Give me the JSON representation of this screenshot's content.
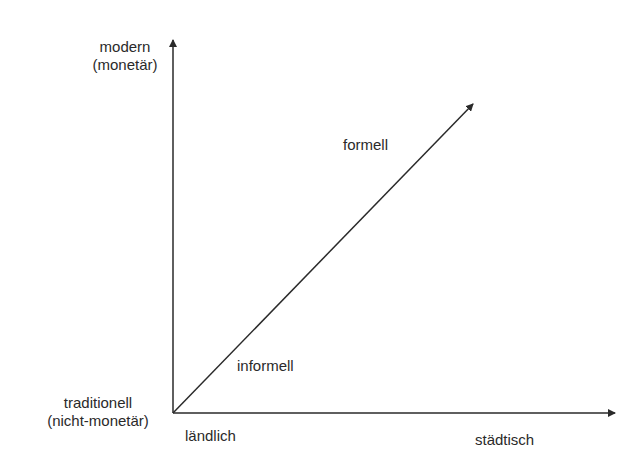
{
  "diagram": {
    "y_axis": {
      "top_label_line1": "modern",
      "top_label_line2": "(monetär)",
      "bottom_label_line1": "traditionell",
      "bottom_label_line2": "(nicht-monetär)"
    },
    "x_axis": {
      "left_label": "ländlich",
      "right_label": "städtisch"
    },
    "diagonal": {
      "upper_label": "formell",
      "lower_label": "informell"
    },
    "colors": {
      "line": "#2a2a2a",
      "background": "#ffffff"
    }
  }
}
